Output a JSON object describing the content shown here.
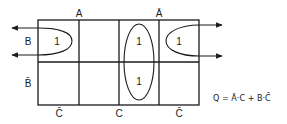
{
  "diagram": {
    "type": "karnaugh-map",
    "column_labels": {
      "top": [
        "A",
        "Ā"
      ],
      "bottom": [
        "C̄",
        "C",
        "C̄"
      ]
    },
    "row_labels": [
      "B",
      "B̄"
    ],
    "cells": [
      [
        "1",
        "",
        "1",
        "1"
      ],
      [
        "",
        "",
        "1",
        ""
      ]
    ],
    "groups": [
      {
        "name": "B·C̄ wrap-around",
        "cells": [
          [
            0,
            0
          ],
          [
            0,
            3
          ]
        ]
      },
      {
        "name": "Ā·C",
        "cells": [
          [
            0,
            2
          ],
          [
            1,
            2
          ]
        ]
      }
    ],
    "equation": "Q = Ā·C + B·C̄",
    "colors": {
      "line": "#1a1a1a",
      "background": "#ffffff"
    }
  }
}
